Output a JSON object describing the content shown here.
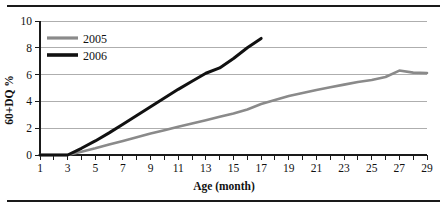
{
  "chart_data": {
    "type": "line",
    "title": "",
    "xlabel": "Age (month)",
    "ylabel": "60+DQ %",
    "xlim": [
      1,
      29
    ],
    "ylim": [
      0,
      10
    ],
    "ytick_step": 2,
    "xtick_step": 1,
    "xtick_label_step": 2,
    "grid": "horizontal",
    "legend_position": "top-left",
    "yticks": [
      "0",
      "2",
      "4",
      "6",
      "8",
      "10"
    ],
    "xticks": [
      "1",
      "3",
      "5",
      "7",
      "9",
      "11",
      "13",
      "15",
      "17",
      "19",
      "21",
      "23",
      "25",
      "27",
      "29"
    ],
    "x": [
      1,
      2,
      3,
      4,
      5,
      6,
      7,
      8,
      9,
      10,
      11,
      12,
      13,
      14,
      15,
      16,
      17,
      18,
      19,
      20,
      21,
      22,
      23,
      24,
      25,
      26,
      27,
      28,
      29
    ],
    "series": [
      {
        "name": "2005",
        "color": "#8a8a8a",
        "width": 2.6,
        "values": [
          0,
          0,
          0,
          0.25,
          0.5,
          0.78,
          1.05,
          1.32,
          1.6,
          1.85,
          2.1,
          2.35,
          2.6,
          2.85,
          3.1,
          3.4,
          3.8,
          4.1,
          4.4,
          4.62,
          4.85,
          5.05,
          5.25,
          5.45,
          5.6,
          5.82,
          6.3,
          6.15,
          6.12
        ]
      },
      {
        "name": "2006",
        "color": "#111111",
        "width": 3.0,
        "values": [
          0,
          0,
          0,
          0.5,
          1.05,
          1.65,
          2.3,
          2.95,
          3.6,
          4.25,
          4.9,
          5.5,
          6.1,
          6.5,
          7.2,
          8.0,
          8.7,
          null,
          null,
          null,
          null,
          null,
          null,
          null,
          null,
          null,
          null,
          null,
          null
        ]
      }
    ]
  },
  "legend": {
    "items": [
      {
        "label": "2005",
        "color": "#8a8a8a"
      },
      {
        "label": "2006",
        "color": "#111111"
      }
    ]
  }
}
